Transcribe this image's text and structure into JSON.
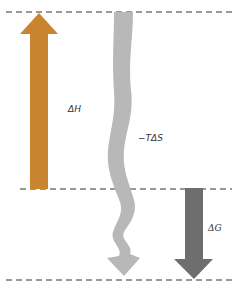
{
  "diagram": {
    "levels": [
      "top",
      "middle",
      "bottom"
    ],
    "arrows": [
      {
        "id": "delta-h",
        "label": "ΔH",
        "direction": "up",
        "color": "#c8842e"
      },
      {
        "id": "minus-t-delta-s",
        "label": "−TΔS",
        "direction": "down",
        "style": "wavy",
        "color": "#b8b8b8"
      },
      {
        "id": "delta-g",
        "label": "ΔG",
        "direction": "down",
        "color": "#6e6e6e"
      }
    ]
  },
  "labels": {
    "delta_h": "ΔH",
    "minus_t_delta_s": "−TΔS",
    "delta_g": "ΔG"
  }
}
